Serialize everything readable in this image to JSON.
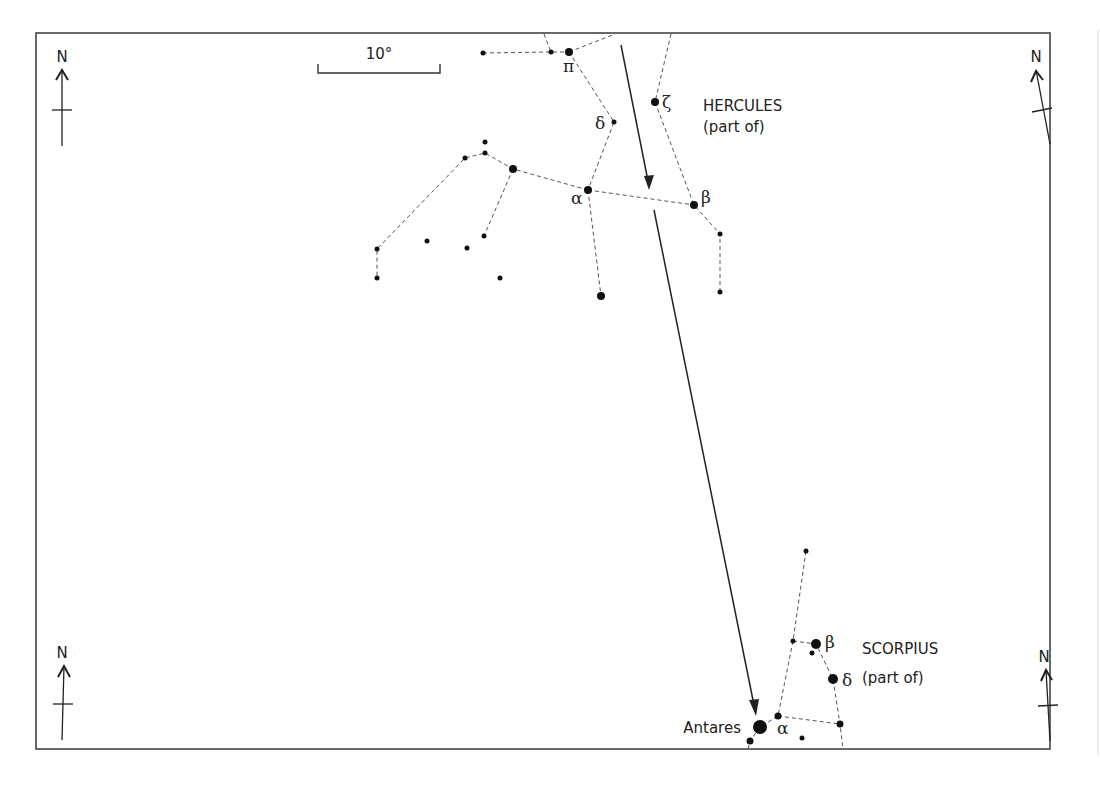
{
  "scale_bar": {
    "label": "10°"
  },
  "compass": {
    "label": "N",
    "positions": [
      "top-left",
      "top-right",
      "bottom-left",
      "bottom-right"
    ]
  },
  "constellations": [
    {
      "name": "HERCULES",
      "note": "(part of)",
      "star_labels": {
        "pi": "π",
        "zeta": "ζ",
        "delta": "δ",
        "alpha": "α",
        "beta": "β"
      }
    },
    {
      "name": "SCORPIUS",
      "note": "(part of)",
      "star_labels": {
        "beta": "β",
        "delta": "δ",
        "alpha": "α"
      },
      "named_star": "Antares"
    }
  ],
  "motion_arrow": {
    "description": "Path line pointing from Hercules toward Antares",
    "color": "#222222"
  },
  "colors": {
    "background": "#ffffff",
    "lines": "#222222",
    "frame": "#444444"
  }
}
